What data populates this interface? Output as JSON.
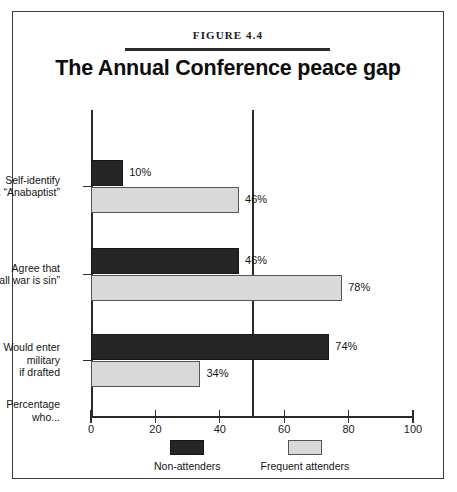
{
  "figure": {
    "number": "FIGURE 4.4",
    "title": "The Annual Conference peace gap"
  },
  "chart_data": {
    "type": "bar",
    "orientation": "horizontal",
    "title": "The Annual Conference peace gap",
    "xlabel": "",
    "ylabel": "Percentage who...",
    "xlim": [
      0,
      100
    ],
    "xticks": [
      0,
      20,
      40,
      60,
      80,
      100
    ],
    "xtick_labels": [
      "0",
      "20",
      "40",
      "60",
      "80",
      "100"
    ],
    "grid": false,
    "reference_line": 50,
    "legend_position": "bottom",
    "categories": [
      "Self-identify as \"Anabaptist\"",
      "Agree that \"all war is sin\"",
      "Would enter military if drafted"
    ],
    "category_label_lines": [
      [
        "Self-identify",
        "as “Anabaptist”"
      ],
      [
        "Agree that",
        "“all war is sin”"
      ],
      [
        "Would enter",
        "military",
        "if drafted"
      ]
    ],
    "series": [
      {
        "name": "Non-attenders",
        "color": "#262626",
        "values": [
          10,
          46,
          74
        ],
        "value_labels": [
          "10%",
          "46%",
          "74%"
        ]
      },
      {
        "name": "Frequent attenders",
        "color": "#d9d9d9",
        "values": [
          46,
          78,
          34
        ],
        "value_labels": [
          "46%",
          "78%",
          "34%"
        ]
      }
    ]
  },
  "axis": {
    "caption_lines": [
      "Percentage",
      "who..."
    ],
    "ticks": [
      {
        "value": 0,
        "label": "0"
      },
      {
        "value": 20,
        "label": "20"
      },
      {
        "value": 40,
        "label": "40"
      },
      {
        "value": 60,
        "label": "60"
      },
      {
        "value": 80,
        "label": "80"
      },
      {
        "value": 100,
        "label": "100"
      }
    ]
  },
  "legend": {
    "items": [
      {
        "label": "Non-attenders",
        "color": "#262626"
      },
      {
        "label": "Frequent attenders",
        "color": "#d9d9d9"
      }
    ]
  },
  "colors": {
    "dark_series": "#262626",
    "light_series": "#d9d9d9",
    "axis": "#2b2b2b",
    "frame": "#3c3c3c",
    "background": "#ffffff"
  }
}
